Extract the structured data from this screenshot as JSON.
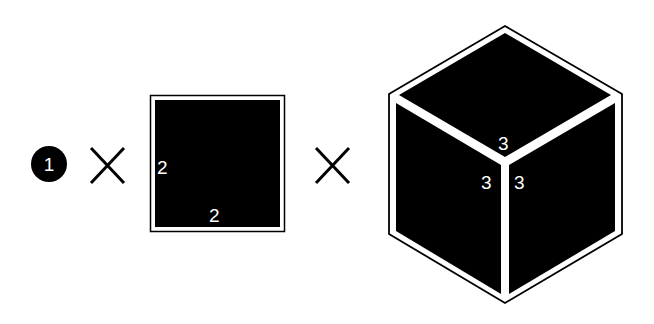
{
  "diagram": {
    "step_badge": {
      "number": "1",
      "color": "#000000",
      "text_color": "#ffffff"
    },
    "operators": [
      "×",
      "×"
    ],
    "square": {
      "fill": "#000000",
      "border": "#000000",
      "side_label": "2",
      "bottom_label": "2"
    },
    "cube": {
      "fill": "#000000",
      "border": "#000000",
      "top_label": "3",
      "left_label": "3",
      "right_label": "3"
    }
  }
}
